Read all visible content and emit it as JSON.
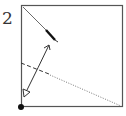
{
  "diagram": {
    "type": "origami-step",
    "step_number": "2",
    "elements": [
      {
        "name": "paper-square",
        "desc": "square sheet outline"
      },
      {
        "name": "existing-crease",
        "desc": "thin diagonal crease with bold end segment"
      },
      {
        "name": "fold-arrow",
        "desc": "double-headed curved arrow, hollow head at bottom-left"
      },
      {
        "name": "valley-fold-line",
        "desc": "dashed line from left edge becoming dotted to bottom-right corner"
      },
      {
        "name": "reference-dot",
        "desc": "solid dot at bottom-left corner"
      }
    ],
    "colors": {
      "line": "#444444",
      "dot": "#111111",
      "background": "#ffffff"
    }
  }
}
